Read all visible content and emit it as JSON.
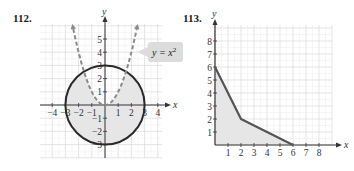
{
  "chart_data": [
    {
      "type": "area",
      "problem_label": "112.",
      "title": "",
      "xlabel": "x",
      "ylabel": "y",
      "xlim": [
        -5,
        4.5
      ],
      "ylim": [
        -3.5,
        6
      ],
      "grid": true,
      "x_ticks": [
        "-4",
        "-3",
        "-2",
        "-1",
        "1",
        "2",
        "3",
        "4"
      ],
      "y_ticks": [
        "-3",
        "-2",
        "-1",
        "1",
        "2",
        "3",
        "4",
        "5"
      ],
      "series": [
        {
          "name": "circle",
          "equation": "x^2 + y^2 = 9",
          "style": "solid",
          "center": [
            0,
            0
          ],
          "radius": 3
        },
        {
          "name": "parabola",
          "equation": "y = x^2",
          "style": "dashed",
          "x_range": [
            -2.4,
            2.4
          ]
        }
      ],
      "shaded_region": "inside circle, below parabola",
      "annotations": [
        {
          "text": "y = x²",
          "target": "parabola"
        }
      ]
    },
    {
      "type": "area",
      "problem_label": "113.",
      "title": "",
      "xlabel": "x",
      "ylabel": "y",
      "xlim": [
        0,
        9
      ],
      "ylim": [
        0,
        9
      ],
      "grid": true,
      "x_ticks": [
        "1",
        "2",
        "3",
        "4",
        "5",
        "6",
        "7",
        "8"
      ],
      "y_ticks": [
        "1",
        "2",
        "3",
        "4",
        "5",
        "6",
        "7",
        "8"
      ],
      "series": [
        {
          "name": "boundary",
          "style": "solid",
          "points": [
            [
              0,
              6
            ],
            [
              2,
              2
            ],
            [
              6,
              0
            ]
          ]
        }
      ],
      "shaded_region": "polygon (0,0),(0,6),(2,2),(6,0)"
    }
  ],
  "labels": {
    "p112": "112.",
    "p113": "113.",
    "eq": "y = x",
    "eq_exp": "2",
    "x": "x",
    "y": "y"
  },
  "colors": {
    "grid": "#d8d8d8",
    "axis": "#333333",
    "curve": "#2a2a2a",
    "parabola": "#8a8a8a",
    "shade": "#e6e6e6",
    "label_box": "#dcdcdc"
  }
}
